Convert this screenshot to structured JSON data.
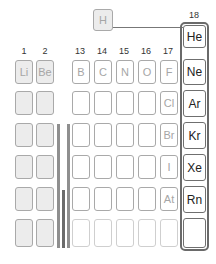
{
  "hydrogen": {
    "symbol": "H"
  },
  "group_numbers": {
    "g1": "1",
    "g2": "2",
    "g13": "13",
    "g14": "14",
    "g15": "15",
    "g16": "16",
    "g17": "17",
    "g18": "18"
  },
  "group1_2": {
    "row2": [
      "Li",
      "Be"
    ]
  },
  "group13_17": {
    "row2": [
      "B",
      "C",
      "N",
      "O",
      "F"
    ],
    "halogens": [
      "Cl",
      "Br",
      "I",
      "At"
    ]
  },
  "noble_gases": [
    "He",
    "Ne",
    "Ar",
    "Kr",
    "Xe",
    "Rn",
    ""
  ],
  "colors": {
    "noble_border": "#6a6a6a",
    "shaded_cell": "#ececec",
    "faded_text": "#a6a6a6",
    "bar": "#8f8f8f"
  }
}
